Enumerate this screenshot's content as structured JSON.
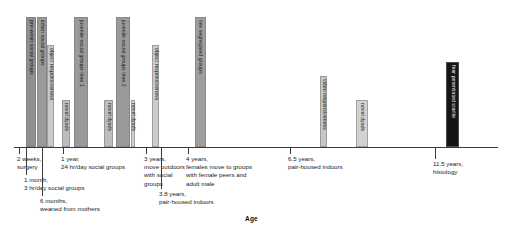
{
  "chart_data": {
    "type": "bar",
    "title": "",
    "subtitle": "",
    "xlabel": "Age",
    "ylabel": "",
    "xlim": [
      0,
      12.2
    ],
    "ylim": [
      0,
      1
    ],
    "grid": false,
    "legend": null,
    "orientation": "timeline-gantt",
    "note": "Experimental timeline: vertical bars mark assessment periods plotted against subject age; callouts below the axis mark housing/rearing events.",
    "categories": [
      "pre-wean social groups",
      "infant social groups",
      "object responsiveness",
      "novel dyads",
      "juvenile social groups time 1",
      "novel dyads",
      "juvenile social groups time 2",
      "novel dyads",
      "object responsiveness",
      "sex segregated groups",
      "video responsiveness",
      "novel dyads",
      "fear potentiated startle"
    ],
    "values": [
      1,
      1,
      1,
      1,
      1,
      1,
      1,
      1,
      1,
      1,
      1,
      1,
      1
    ],
    "bars": [
      {
        "label": "pre-wean social groups",
        "x_start": 0.3,
        "x_end": 0.55,
        "top": 17,
        "height": 130,
        "color": "#8f8f8f"
      },
      {
        "label": "infant social groups",
        "x_start": 0.57,
        "x_end": 0.82,
        "top": 17,
        "height": 130,
        "color": "#9a9a9a"
      },
      {
        "label": "object responsiveness",
        "x_start": 0.84,
        "x_end": 1.02,
        "top": 45,
        "height": 102,
        "color": "#c9c9c9"
      },
      {
        "label": "novel dyads",
        "x_start": 1.2,
        "x_end": 1.42,
        "top": 100,
        "height": 47,
        "color": "#bdbdbd"
      },
      {
        "label": "juvenile social groups time 1",
        "x_start": 1.52,
        "x_end": 1.86,
        "top": 17,
        "height": 130,
        "color": "#9a9a9a"
      },
      {
        "label": "novel dyads",
        "x_start": 2.28,
        "x_end": 2.5,
        "top": 100,
        "height": 47,
        "color": "#bdbdbd"
      },
      {
        "label": "juvenile social groups time 2",
        "x_start": 2.58,
        "x_end": 2.92,
        "top": 17,
        "height": 130,
        "color": "#9a9a9a"
      },
      {
        "label": "novel dyads",
        "x_start": 2.94,
        "x_end": 3.06,
        "top": 100,
        "height": 47,
        "color": "#cfcfcf"
      },
      {
        "label": "object responsiveness",
        "x_start": 3.48,
        "x_end": 3.66,
        "top": 45,
        "height": 102,
        "color": "#cccccc"
      },
      {
        "label": "sex segregated groups",
        "x_start": 4.55,
        "x_end": 4.85,
        "top": 17,
        "height": 130,
        "color": "#9e9e9e"
      },
      {
        "label": "video responsiveness",
        "x_start": 7.72,
        "x_end": 7.9,
        "top": 76,
        "height": 71,
        "color": "#c6c6c6"
      },
      {
        "label": "novel dyads",
        "x_start": 8.62,
        "x_end": 8.92,
        "top": 100,
        "height": 47,
        "color": "#d2d2d2"
      },
      {
        "label": "fear potentiated startle",
        "x_start": 10.9,
        "x_end": 11.22,
        "top": 62,
        "height": 85,
        "color": "#151515"
      }
    ],
    "events": [
      {
        "age": "2 weeks",
        "text": "2 weeks,\nsurgery"
      },
      {
        "age": "1 month",
        "text": "1 month,\n3 hr/day social groups"
      },
      {
        "age": "6 months",
        "text": "6 months,\nweaned from mothers"
      },
      {
        "age": "1 year",
        "text": "1 year,\n24 hr/day social groups"
      },
      {
        "age": "3 years",
        "text": "3 years,\nmove outdoors\nwith social\ngroups"
      },
      {
        "age": "3.8 years",
        "text": "3.8 years,\npair-housed indoors"
      },
      {
        "age": "4 years",
        "text": "4 years,\nfemales move to groups\nwith female peers and\nadult male"
      },
      {
        "age": "6.5 years",
        "text": "6.5 years,\npair-housed indoors"
      },
      {
        "age": "11.5 years",
        "text": "11.5 years,\nhistology"
      }
    ],
    "callouts": [
      {
        "name": "callout-2-weeks",
        "text": "2 weeks,\nsurgery",
        "x": 17,
        "y": 155,
        "tick_x": 19,
        "tick_y": 147,
        "tick_h": 7
      },
      {
        "name": "callout-1-month",
        "text": "1 month,\n3 hr/day social groups",
        "x": 24,
        "y": 176,
        "tick_x": 26,
        "tick_y": 147,
        "tick_h": 28
      },
      {
        "name": "callout-6-months",
        "text": "6 months,\nweaned from mothers",
        "x": 40,
        "y": 197,
        "tick_x": 42,
        "tick_y": 147,
        "tick_h": 49
      },
      {
        "name": "callout-1-year",
        "text": "1 year,\n24 hr/day social groups",
        "x": 61,
        "y": 155,
        "tick_x": 63,
        "tick_y": 147,
        "tick_h": 7
      },
      {
        "name": "callout-3-years",
        "text": "3 years,\nmove outdoors\nwith social\ngroups",
        "x": 144,
        "y": 155,
        "tick_x": 146,
        "tick_y": 147,
        "tick_h": 7
      },
      {
        "name": "callout-3-8-years",
        "text": "3.8 years,\npair-housed indoors",
        "x": 159,
        "y": 190,
        "tick_x": 161,
        "tick_y": 147,
        "tick_h": 42
      },
      {
        "name": "callout-4-years",
        "text": "4 years,\nfemales move to groups\nwith female peers and\nadult male",
        "x": 186,
        "y": 155,
        "tick_x": 188,
        "tick_y": 147,
        "tick_h": 7
      },
      {
        "name": "callout-6-5-years",
        "text": "6.5 years,\npair-housed indoors",
        "x": 288,
        "y": 155,
        "tick_x": 290,
        "tick_y": 147,
        "tick_h": 7
      },
      {
        "name": "callout-11-5-years",
        "text": "11.5 years,\nhistology",
        "x": 433,
        "y": 160,
        "tick_x": 435,
        "tick_y": 147,
        "tick_h": 12
      }
    ]
  },
  "axis": {
    "label": "Age"
  }
}
